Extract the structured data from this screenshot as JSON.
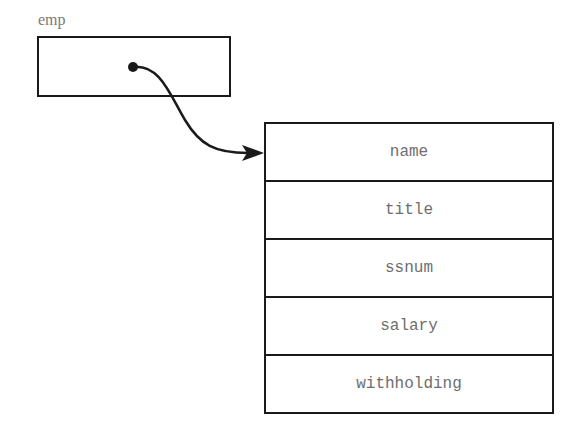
{
  "variable": {
    "name": "emp"
  },
  "struct": {
    "fields": [
      {
        "label": "name"
      },
      {
        "label": "title"
      },
      {
        "label": "ssnum"
      },
      {
        "label": "salary"
      },
      {
        "label": "withholding"
      }
    ]
  },
  "colors": {
    "line": "#1a1a1a",
    "text": "#6e6e6e"
  }
}
